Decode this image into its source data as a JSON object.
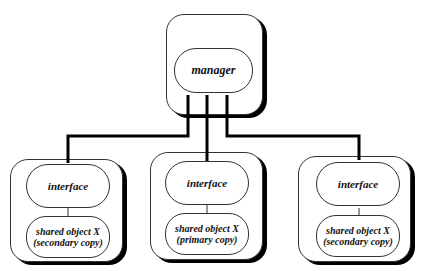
{
  "manager": {
    "label": "manager"
  },
  "nodes": [
    {
      "interface": "interface",
      "object_line1": "shared object X",
      "object_line2": "(secondary copy)"
    },
    {
      "interface": "interface",
      "object_line1": "shared object X",
      "object_line2": "(primary copy)"
    },
    {
      "interface": "interface",
      "object_line1": "shared object X",
      "object_line2": "(secondary copy)"
    }
  ]
}
